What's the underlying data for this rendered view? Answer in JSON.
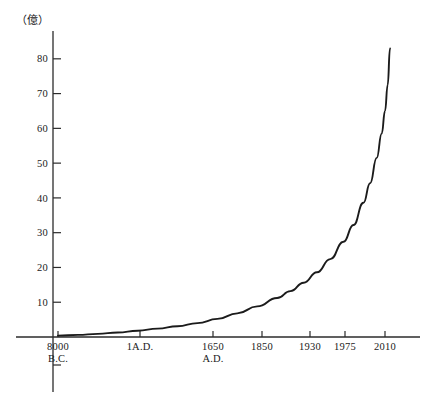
{
  "chart_data": {
    "type": "line",
    "title": "",
    "subtitle": "",
    "unit_label": "（億）",
    "ylabel": "",
    "xlabel": "",
    "ylim": [
      0,
      88
    ],
    "yticks": [
      10,
      20,
      30,
      40,
      50,
      60,
      70,
      80
    ],
    "ytick_labels": [
      "10",
      "20",
      "30",
      "40",
      "50",
      "60",
      "70",
      "80"
    ],
    "grid": false,
    "legend": "none",
    "xtick_labels": [
      {
        "line1": "8000",
        "line2": "B.C."
      },
      {
        "line1": "1A.D.",
        "line2": ""
      },
      {
        "line1": "1650",
        "line2": "A.D."
      },
      {
        "line1": "1850",
        "line2": ""
      },
      {
        "line1": "1930",
        "line2": ""
      },
      {
        "line1": "1975",
        "line2": ""
      },
      {
        "line1": "2010",
        "line2": ""
      }
    ],
    "categories": [
      "8000 B.C.",
      "1 A.D.",
      "1650 A.D.",
      "1850",
      "1930",
      "1975",
      "2010"
    ],
    "values": [
      0.5,
      2.0,
      5.0,
      12.0,
      20.0,
      40.0,
      69.0
    ],
    "series": [
      {
        "name": "World population",
        "values": [
          0.5,
          2.0,
          5.0,
          12.0,
          20.0,
          40.0,
          69.0
        ]
      }
    ],
    "curve_points": [
      [
        0.0,
        0.4
      ],
      [
        0.06,
        0.6
      ],
      [
        0.12,
        0.9
      ],
      [
        0.18,
        1.3
      ],
      [
        0.24,
        1.8
      ],
      [
        0.3,
        2.4
      ],
      [
        0.36,
        3.1
      ],
      [
        0.42,
        4.0
      ],
      [
        0.48,
        5.2
      ],
      [
        0.54,
        6.8
      ],
      [
        0.6,
        8.8
      ],
      [
        0.66,
        11.2
      ],
      [
        0.7,
        13.2
      ],
      [
        0.74,
        15.6
      ],
      [
        0.78,
        18.6
      ],
      [
        0.82,
        22.4
      ],
      [
        0.86,
        27.4
      ],
      [
        0.89,
        32.2
      ],
      [
        0.92,
        38.6
      ],
      [
        0.94,
        44.2
      ],
      [
        0.96,
        51.5
      ],
      [
        0.975,
        58.5
      ],
      [
        0.985,
        65.0
      ],
      [
        0.993,
        72.5
      ],
      [
        1.0,
        83.0
      ]
    ],
    "colors": {
      "curve": "#1b1b1b",
      "axis": "#2b2b2b",
      "text": "#1a1a1a",
      "background": "#ffffff"
    }
  }
}
